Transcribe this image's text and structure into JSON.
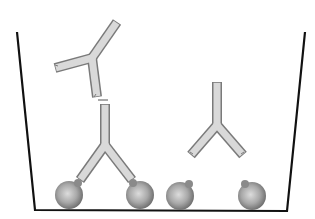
{
  "diagram": {
    "description": "Antibody-antigen binding illustration: free Y-shaped antibodies and antigen-coated beads in a container; one antibody bridges two beads",
    "colors": {
      "background": "#ffffff",
      "container_line": "#111111",
      "antibody_fill": "#d9d9d9",
      "antibody_outline": "#7a7a7a",
      "bead_light": "#d0d0d0",
      "bead_dark": "#6e6e6e"
    },
    "container": {
      "points": [
        [
          17,
          32
        ],
        [
          35,
          210
        ],
        [
          287,
          211
        ],
        [
          305,
          32
        ]
      ]
    },
    "antibodies": [
      {
        "id": "free-top-left",
        "state": "free",
        "junction": [
          92,
          58
        ],
        "tips": [
          [
            117,
            22
          ],
          [
            55,
            68
          ],
          [
            97,
            97
          ]
        ]
      },
      {
        "id": "bound-middle",
        "state": "bound",
        "junction": [
          105,
          145
        ],
        "tips": [
          [
            105,
            104
          ],
          [
            80,
            180
          ],
          [
            132,
            180
          ]
        ]
      },
      {
        "id": "free-right",
        "state": "free",
        "junction": [
          217,
          125
        ],
        "tips": [
          [
            217,
            82
          ],
          [
            191,
            155
          ],
          [
            243,
            155
          ]
        ]
      }
    ],
    "beads": [
      {
        "id": "bead-1",
        "cx": 69,
        "cy": 195,
        "r": 14,
        "bound": true
      },
      {
        "id": "bead-2",
        "cx": 140,
        "cy": 195,
        "r": 14,
        "bound": true
      },
      {
        "id": "bead-3",
        "cx": 180,
        "cy": 196,
        "r": 14,
        "bound": false
      },
      {
        "id": "bead-4",
        "cx": 252,
        "cy": 196,
        "r": 14,
        "bound": false
      }
    ]
  }
}
